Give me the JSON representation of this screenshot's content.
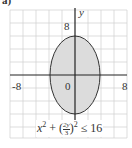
{
  "part_label": "a)",
  "axes": {
    "x_label": "",
    "y_label": "y",
    "tick_labels": {
      "x_neg": "-8",
      "x_pos": "8",
      "y_pos": "8",
      "origin": "0"
    }
  },
  "region": {
    "type": "ellipse",
    "center": [
      0,
      0
    ],
    "semi_axis_x": 4,
    "semi_axis_y": 6,
    "fill": "#d9d9d9",
    "stroke": "#333333"
  },
  "inequality": {
    "text": "x² + (2y/3)² ≤ 16",
    "lhs_a": "x",
    "frac_num": "2y",
    "frac_den": "3",
    "rhs": "≤ 16"
  },
  "grid": {
    "min": -10,
    "max": 10,
    "step": 2,
    "color": "#c8c8c8"
  }
}
